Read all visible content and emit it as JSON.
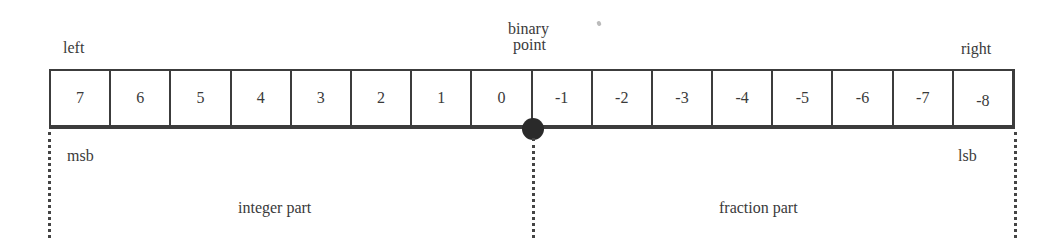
{
  "labels": {
    "left": "left",
    "right": "right",
    "binary_point_line1": "binary",
    "binary_point_line2": "point",
    "msb": "msb",
    "lsb": "lsb",
    "integer_part": "integer part",
    "fraction_part": "fraction part"
  },
  "bits": [
    "7",
    "6",
    "5",
    "4",
    "3",
    "2",
    "1",
    "0",
    "-1",
    "-2",
    "-3",
    "-4",
    "-5",
    "-6",
    "-7",
    "-8"
  ]
}
